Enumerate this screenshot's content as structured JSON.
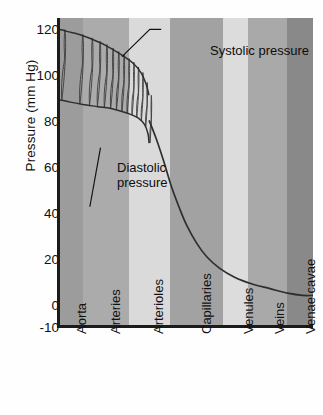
{
  "chart_data": {
    "type": "line",
    "title": "",
    "subtitle": "",
    "xlabel": "",
    "ylabel": "Pressure (mm Hg)",
    "ylim": [
      -10,
      125
    ],
    "yticks": [
      120,
      100,
      80,
      60,
      40,
      20,
      0,
      -10
    ],
    "ytick_labels": [
      "120",
      "100",
      "80",
      "60",
      "40",
      "20",
      "0",
      "-10"
    ],
    "grid": false,
    "legend_position": "none",
    "categories": [
      "Aorta",
      "Arteries",
      "Arterioles",
      "Capillaries",
      "Venules",
      "Veins",
      "Venae cavae"
    ],
    "band_colors": [
      "#9c9c9c",
      "#ababab",
      "#dadada",
      "#a2a2a2",
      "#dcdcdc",
      "#a9a9a9",
      "#898989"
    ],
    "band_fractions": [
      0.09,
      0.184,
      0.16,
      0.211,
      0.098,
      0.156,
      0.101
    ],
    "annotations": [
      {
        "name": "systolic",
        "text": "Systolic pressure",
        "x_frac": 0.245,
        "y_value": 108
      },
      {
        "name": "diastolic",
        "text": "Diastolic pressure",
        "x_frac": 0.16,
        "y_value": 68
      }
    ],
    "series": [
      {
        "name": "Systolic pressure",
        "points": [
          [
            0.0,
            120
          ],
          [
            0.03,
            119
          ],
          [
            0.07,
            118
          ],
          [
            0.12,
            116
          ],
          [
            0.18,
            113
          ],
          [
            0.24,
            109
          ],
          [
            0.29,
            105
          ],
          [
            0.32,
            101
          ],
          [
            0.34,
            96
          ],
          [
            0.352,
            91
          ]
        ]
      },
      {
        "name": "Diastolic pressure",
        "points": [
          [
            0.0,
            89
          ],
          [
            0.04,
            88
          ],
          [
            0.09,
            87
          ],
          [
            0.15,
            86
          ],
          [
            0.21,
            85
          ],
          [
            0.27,
            83
          ],
          [
            0.31,
            81
          ],
          [
            0.335,
            78
          ],
          [
            0.348,
            74
          ],
          [
            0.352,
            70
          ]
        ]
      },
      {
        "name": "Mean pressure",
        "points": [
          [
            0.352,
            80
          ],
          [
            0.38,
            72
          ],
          [
            0.41,
            62
          ],
          [
            0.44,
            51
          ],
          [
            0.47,
            42
          ],
          [
            0.5,
            34
          ],
          [
            0.54,
            26
          ],
          [
            0.58,
            20
          ],
          [
            0.63,
            15
          ],
          [
            0.69,
            11
          ],
          [
            0.76,
            8
          ],
          [
            0.83,
            6
          ],
          [
            0.9,
            4
          ],
          [
            0.96,
            3
          ],
          [
            1.0,
            3
          ]
        ]
      }
    ],
    "pulse_count": 14
  }
}
